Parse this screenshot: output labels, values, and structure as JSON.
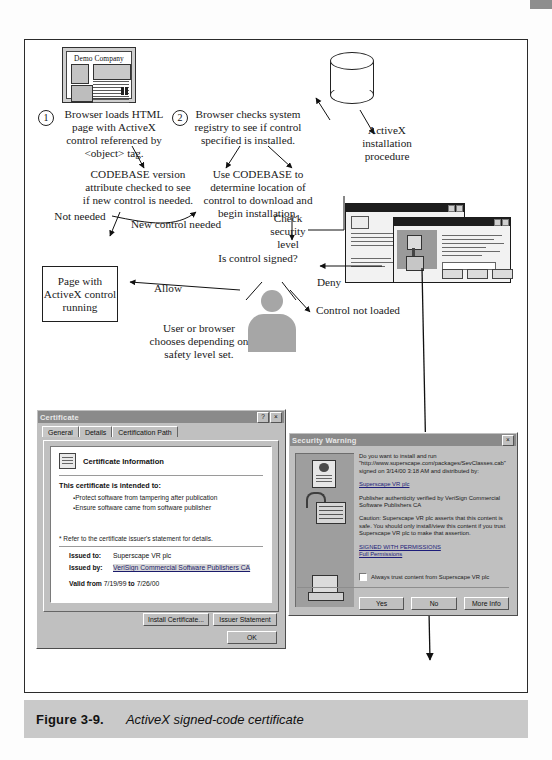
{
  "figure": {
    "number": "Figure 3-9.",
    "caption": "ActiveX signed-code certificate"
  },
  "diagram": {
    "steps": [
      {
        "num": "1",
        "text": "Browser loads HTML page with ActiveX control referenced by <object> tag."
      },
      {
        "num": "2",
        "text": "Browser checks system registry to see if control specified is installed."
      }
    ],
    "nodes": {
      "demo_window_title": "Demo Company",
      "codebase_version": "CODEBASE version attribute checked to see if new control is needed.",
      "use_codebase": "Use CODEBASE to determine location of control to download and begin installation.",
      "activex_install": "ActiveX installation procedure",
      "check_security": "Check security level",
      "is_signed": "Is control signed?",
      "page_running": "Page with ActiveX control running",
      "control_not_loaded": "Control not loaded",
      "user_or_browser": "User or browser chooses depending on safety level set."
    },
    "edge_labels": {
      "not_needed": "Not needed",
      "new_control_needed": "New control needed",
      "allow": "Allow",
      "deny": "Deny"
    }
  },
  "cert_dialog": {
    "title": "Certificate",
    "help_button": "?",
    "close_button": "×",
    "tabs": [
      {
        "label": "General",
        "active": true
      },
      {
        "label": "Details",
        "active": false
      },
      {
        "label": "Certification Path",
        "active": false
      }
    ],
    "info_heading": "Certificate Information",
    "intended_label": "This certificate is intended to:",
    "intended_items": [
      "Protect software from tampering after publication",
      "Ensure software came from software publisher"
    ],
    "footnote": "* Refer to the certificate issuer's statement for details.",
    "issued_to_label": "Issued to:",
    "issued_to_value": "Superscape VR plc",
    "issued_by_label": "Issued by:",
    "issued_by_value": "VeriSign Commercial Software Publishers CA",
    "valid_label": "Valid from",
    "valid_from": "7/19/99",
    "valid_to_label": "to",
    "valid_to": "7/26/00",
    "buttons": {
      "install": "Install Certificate...",
      "issuer": "Issuer Statement",
      "ok": "OK"
    }
  },
  "security_dialog": {
    "title": "Security Warning",
    "close_button": "×",
    "question": "Do you want to install and run \"http://www.superscape.com/packages/SevClasses.cab\" signed on 3/14/00 3:18 AM and distributed by:",
    "publisher_link": "Superscape VR plc",
    "authenticity": "Publisher authenticity verified by VeriSign Commercial Software Publishers CA",
    "caution": "Caution: Superscape VR plc asserts that this content is safe. You should only install/view this content if you trust Superscape VR plc to make that assertion.",
    "signed_with": "SIGNED WITH PERMISSIONS",
    "full_permissions": "Full Permissions",
    "trust_checkbox_label": "Always trust content from Superscape VR plc",
    "trust_checkbox_checked": false,
    "buttons": {
      "yes": "Yes",
      "no": "No",
      "more_info": "More Info"
    }
  },
  "colors": {
    "caption_bar": "#c9c9c9",
    "dialog_face": "#c0c0c0",
    "titlebar": "#8a8a8a",
    "silhouette": "#a6a6a6",
    "link": "#1d1d7a"
  }
}
